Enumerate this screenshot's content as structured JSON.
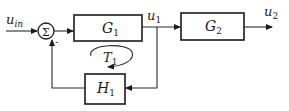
{
  "diagram": {
    "type": "block-diagram",
    "signals": {
      "input": {
        "main": "u",
        "sub": "in"
      },
      "intermediate": {
        "main": "u",
        "sub": "1"
      },
      "output": {
        "main": "u",
        "sub": "2"
      }
    },
    "summing_junction": {
      "symbol": "Σ",
      "feedback_sign": "-"
    },
    "blocks": {
      "g1": {
        "main": "G",
        "sub": "1"
      },
      "g2": {
        "main": "G",
        "sub": "2"
      },
      "h1": {
        "main": "H",
        "sub": "1"
      }
    },
    "loop_label": {
      "main": "T",
      "sub": "1"
    },
    "colors": {
      "line": "#2a2a2a",
      "background": "#ffffff"
    }
  }
}
